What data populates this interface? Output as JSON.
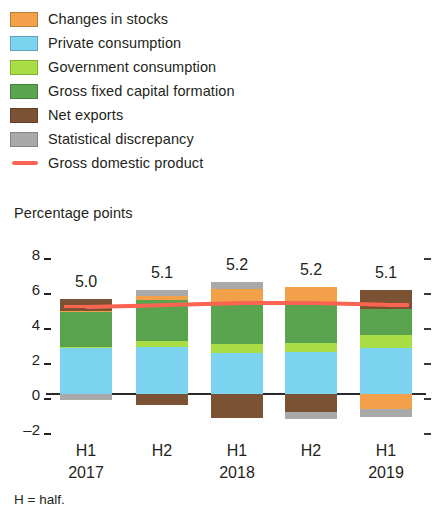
{
  "legend": {
    "items": [
      {
        "label": "Changes in stocks",
        "color": "#f2a04a",
        "type": "swatch",
        "icon": "legend-swatch-icon"
      },
      {
        "label": "Private consumption",
        "color": "#7cd3f0",
        "type": "swatch",
        "icon": "legend-swatch-icon"
      },
      {
        "label": "Government consumption",
        "color": "#a8dd46",
        "type": "swatch",
        "icon": "legend-swatch-icon"
      },
      {
        "label": "Gross fixed capital formation",
        "color": "#5aa44f",
        "type": "swatch",
        "icon": "legend-swatch-icon"
      },
      {
        "label": "Net exports",
        "color": "#7b5334",
        "type": "swatch",
        "icon": "legend-swatch-icon"
      },
      {
        "label": "Statistical discrepancy",
        "color": "#a9a9a9",
        "type": "swatch",
        "icon": "legend-swatch-icon"
      },
      {
        "label": "Gross domestic product",
        "color": "#fa6450",
        "type": "line",
        "icon": "legend-line-icon"
      }
    ]
  },
  "axis_title": "Percentage points",
  "footnote": "H = half.",
  "yticks": [
    {
      "label": "8",
      "value": 8
    },
    {
      "label": "6",
      "value": 6
    },
    {
      "label": "4",
      "value": 4
    },
    {
      "label": "2",
      "value": 2
    },
    {
      "label": "0",
      "value": 0
    },
    {
      "label": "–2",
      "value": -2
    }
  ],
  "xlabels": [
    {
      "period": "H1",
      "year": "2017"
    },
    {
      "period": "H2",
      "year": ""
    },
    {
      "period": "H1",
      "year": "2018"
    },
    {
      "period": "H2",
      "year": ""
    },
    {
      "period": "H1",
      "year": "2019"
    }
  ],
  "chart_data": {
    "type": "bar",
    "stacked": true,
    "title": "",
    "subtitle": "",
    "xlabel": "",
    "ylabel": "Percentage points",
    "ylim": [
      -2.6,
      8.4
    ],
    "grid": false,
    "legend_position": "top-left",
    "categories": [
      "H1 2017",
      "H2 2017",
      "H1 2018",
      "H2 2018",
      "H1 2019"
    ],
    "series": [
      {
        "name": "Private consumption",
        "color": "#7cd3f0",
        "values": [
          2.65,
          2.7,
          2.35,
          2.4,
          2.65
        ]
      },
      {
        "name": "Government consumption",
        "color": "#a8dd46",
        "values": [
          0.05,
          0.35,
          0.5,
          0.5,
          0.7
        ]
      },
      {
        "name": "Gross fixed capital formation",
        "color": "#5aa44f",
        "values": [
          2.0,
          2.35,
          2.35,
          2.3,
          1.5
        ]
      },
      {
        "name": "Changes in stocks",
        "color": "#f2a04a",
        "values": [
          0.05,
          0.2,
          0.8,
          0.9,
          -0.85
        ]
      },
      {
        "name": "Net exports",
        "color": "#7b5334",
        "values": [
          0.7,
          -0.6,
          -1.35,
          -1.05,
          1.1
        ]
      },
      {
        "name": "Statistical discrepancy",
        "color": "#a9a9a9",
        "values": [
          -0.35,
          0.35,
          0.4,
          -0.35,
          -0.45
        ]
      }
    ],
    "gdp_line": {
      "name": "Gross domestic product",
      "color": "#fa6450",
      "values": [
        5.0,
        5.1,
        5.2,
        5.2,
        5.1
      ],
      "labels": [
        "5.0",
        "5.1",
        "5.2",
        "5.2",
        "5.1"
      ]
    }
  },
  "plot_geometry": {
    "zero_y": 164,
    "px_per_unit": 17.5,
    "bar_x": [
      60,
      136,
      211,
      285,
      360
    ],
    "bar_width": 52,
    "label_x": [
      86,
      162,
      237,
      311,
      386
    ],
    "ytick_label_x": 40,
    "ytick_dash_left_x": 44,
    "ytick_dash_right_x": 424,
    "zero_line_x": 46,
    "zero_line_w": 380
  }
}
